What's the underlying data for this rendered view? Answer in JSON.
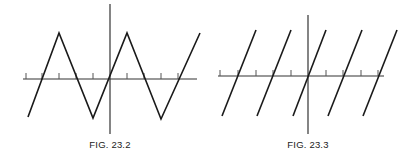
{
  "figures": [
    {
      "caption": "FIG. 23.2",
      "type": "triangle-wave",
      "axis": {
        "origin_x": 110,
        "origin_y": 79,
        "x_start": 23,
        "x_end": 197,
        "y_top": 4,
        "y_bottom": 134
      },
      "ticks_x": [
        26,
        42,
        59,
        76,
        93,
        127,
        144,
        161,
        178
      ],
      "polyline": [
        [
          28,
          117
        ],
        [
          59,
          33
        ],
        [
          93,
          118
        ],
        [
          127,
          33
        ],
        [
          161,
          119
        ],
        [
          200,
          33
        ]
      ]
    },
    {
      "caption": "FIG. 23.3",
      "type": "sawtooth-segments",
      "axis": {
        "origin_x": 308,
        "origin_y": 76,
        "x_start": 218,
        "x_end": 384,
        "y_top": 15,
        "y_bottom": 134
      },
      "ticks_x": [
        220,
        238,
        256,
        273,
        291,
        326,
        343,
        361,
        378
      ],
      "segments": [
        [
          [
            222,
            116
          ],
          [
            256,
            30
          ]
        ],
        [
          [
            257,
            116
          ],
          [
            291,
            30
          ]
        ],
        [
          [
            293,
            116
          ],
          [
            326,
            30
          ]
        ],
        [
          [
            328,
            116
          ],
          [
            362,
            30
          ]
        ],
        [
          [
            363,
            116
          ],
          [
            397,
            30
          ]
        ]
      ]
    }
  ],
  "colors": {
    "line": "#1a1a1a",
    "axis": "#333333",
    "tick": "#555555"
  }
}
